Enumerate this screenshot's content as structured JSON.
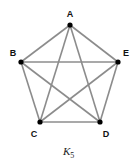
{
  "diagram": {
    "caption": {
      "main": "K",
      "sub": "5"
    },
    "edge_color": "#8c8c8c",
    "node_color": "#000000",
    "nodes": [
      {
        "id": "A",
        "label": "A",
        "x": 70,
        "y": 25,
        "lx": 70,
        "ly": 17
      },
      {
        "id": "B",
        "label": "B",
        "x": 21,
        "y": 62,
        "lx": 13,
        "ly": 56
      },
      {
        "id": "E",
        "label": "E",
        "x": 118,
        "y": 62,
        "lx": 126,
        "ly": 56
      },
      {
        "id": "C",
        "label": "C",
        "x": 40,
        "y": 122,
        "lx": 34,
        "ly": 137
      },
      {
        "id": "D",
        "label": "D",
        "x": 100,
        "y": 122,
        "lx": 106,
        "ly": 137
      }
    ],
    "edges": [
      [
        "A",
        "B"
      ],
      [
        "A",
        "C"
      ],
      [
        "A",
        "D"
      ],
      [
        "A",
        "E"
      ],
      [
        "B",
        "C"
      ],
      [
        "B",
        "D"
      ],
      [
        "B",
        "E"
      ],
      [
        "C",
        "D"
      ],
      [
        "C",
        "E"
      ],
      [
        "D",
        "E"
      ]
    ]
  }
}
